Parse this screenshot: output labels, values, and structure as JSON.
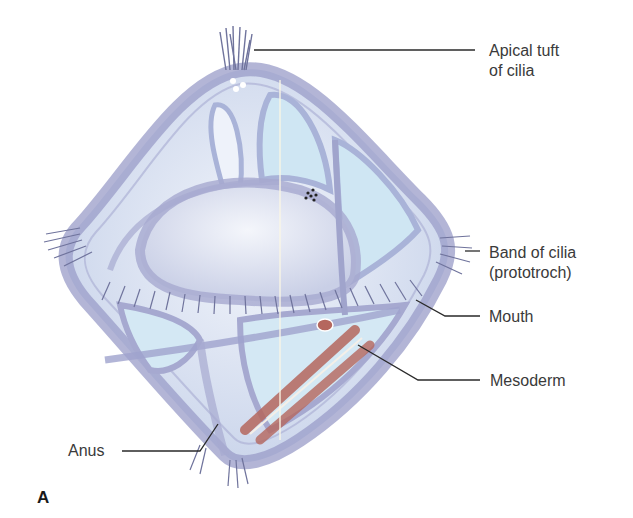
{
  "figure": {
    "panel_letter": "A",
    "colors": {
      "body_outline": "#9a9cc8",
      "body_fill": "#dfe6f3",
      "inner_fill": "#cfe6f3",
      "cilia": "#6f739c",
      "mesoderm": "#b5675e",
      "leader_line": "#2a2a2a",
      "label_text": "#3a3a3a"
    },
    "labels": {
      "apical_tuft_line1": "Apical tuft",
      "apical_tuft_line2": "of cilia",
      "band_line1": "Band of cilia",
      "band_line2": "(prototroch)",
      "mouth": "Mouth",
      "mesoderm": "Mesoderm",
      "anus": "Anus"
    }
  }
}
